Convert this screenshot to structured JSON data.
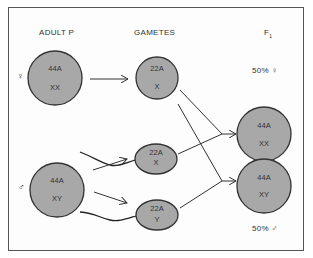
{
  "headers": {
    "adult": "ADULT  P",
    "gametes": "GAMETES",
    "f1": "F",
    "f1_sub": "1"
  },
  "symbols": {
    "female": "♀",
    "male": "♂"
  },
  "adults": [
    {
      "sex": "female",
      "line1": "44A",
      "line2": "XX"
    },
    {
      "sex": "male",
      "line1": "44A",
      "line2": "XY"
    }
  ],
  "gametes": [
    {
      "type": "egg",
      "line1": "22A",
      "line2": "X"
    },
    {
      "type": "sperm",
      "line1": "22A",
      "line2": "X"
    },
    {
      "type": "sperm",
      "line1": "22A",
      "line2": "Y"
    }
  ],
  "offspring": [
    {
      "line1": "44A",
      "line2": "XX",
      "percent": "50% ♀"
    },
    {
      "line1": "44A",
      "line2": "XY",
      "percent": "50% ♂"
    }
  ],
  "colors": {
    "cell_fill": "#a8a8a8",
    "stroke": "#333333"
  }
}
